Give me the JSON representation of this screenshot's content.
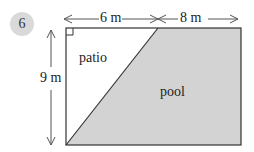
{
  "problem": {
    "number": "6"
  },
  "diagram": {
    "top_left_dimension": "6 m",
    "top_right_dimension": "8 m",
    "height_dimension": "9 m",
    "region_left_label": "patio",
    "region_right_label": "pool",
    "colors": {
      "pool_fill": "#d3d3d3",
      "stroke": "#333333"
    }
  }
}
